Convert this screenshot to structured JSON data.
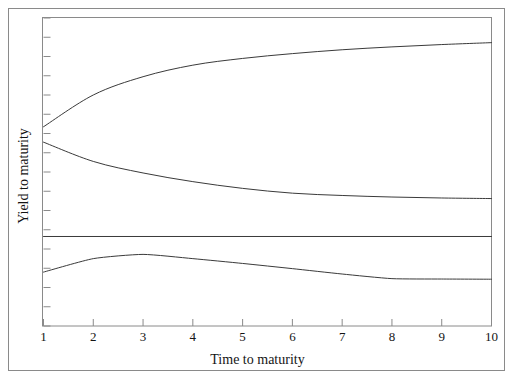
{
  "figure": {
    "background": "#ffffff",
    "line_color": "#3a3a3a",
    "frame_color": "#8a8a8a"
  },
  "axes": {
    "x_title": "Time to maturity",
    "y_title": "Yield to maturity",
    "x_tick_labels": [
      "1",
      "2",
      "3",
      "4",
      "5",
      "6",
      "7",
      "8",
      "9",
      "10"
    ],
    "y_tick_labels": []
  },
  "chart_data": {
    "type": "line",
    "title": "",
    "xlabel": "Time to maturity",
    "ylabel": "Yield to maturity",
    "xlim": [
      1,
      10
    ],
    "ylim": [
      0,
      16
    ],
    "grid": false,
    "legend": "none",
    "x": [
      1,
      2,
      3,
      4,
      5,
      6,
      7,
      8,
      9,
      10
    ],
    "x_tick_labels": [
      "1",
      "2",
      "3",
      "4",
      "5",
      "6",
      "7",
      "8",
      "9",
      "10"
    ],
    "y_tick_count": 17,
    "y_ticks_labeled": false,
    "series": [
      {
        "name": "upward-sloping",
        "values": [
          10.35,
          12.0,
          12.95,
          13.55,
          13.9,
          14.15,
          14.35,
          14.5,
          14.62,
          14.72
        ]
      },
      {
        "name": "downward-sloping",
        "values": [
          9.55,
          8.55,
          7.95,
          7.5,
          7.15,
          6.9,
          6.78,
          6.7,
          6.65,
          6.62
        ]
      },
      {
        "name": "flat",
        "values": [
          4.65,
          4.65,
          4.65,
          4.65,
          4.65,
          4.65,
          4.65,
          4.65,
          4.65,
          4.65
        ]
      },
      {
        "name": "humped",
        "values": [
          2.8,
          3.5,
          3.72,
          3.5,
          3.25,
          2.98,
          2.7,
          2.46,
          2.44,
          2.43
        ]
      }
    ]
  }
}
